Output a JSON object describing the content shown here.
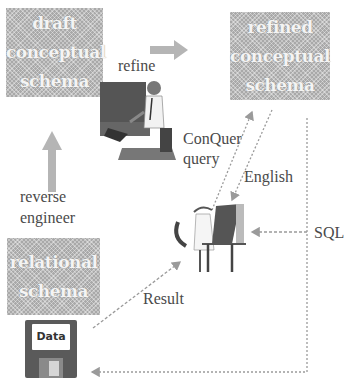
{
  "diagram": {
    "boxes": {
      "draft": {
        "lines": [
          "draft",
          "conceptual",
          "schema"
        ]
      },
      "refined": {
        "lines": [
          "refined",
          "conceptual",
          "schema"
        ]
      },
      "relational": {
        "lines": [
          "relational",
          "schema"
        ]
      }
    },
    "labels": {
      "refine": "refine",
      "reverse": "reverse",
      "engineer": "engineer",
      "conquer": "ConQuer",
      "query": "query",
      "english": "English",
      "sql": "SQL",
      "result": "Result"
    },
    "data_store": {
      "label": "Data",
      "icon": "floppy-disk-icon"
    },
    "figures": {
      "designer": "person-at-computer-icon",
      "user": "seated-user-at-computer-icon"
    },
    "colors": {
      "box_fill": "#a9a9a9",
      "arrow": "#9a9a9a",
      "text": "#4a4a4a"
    }
  }
}
